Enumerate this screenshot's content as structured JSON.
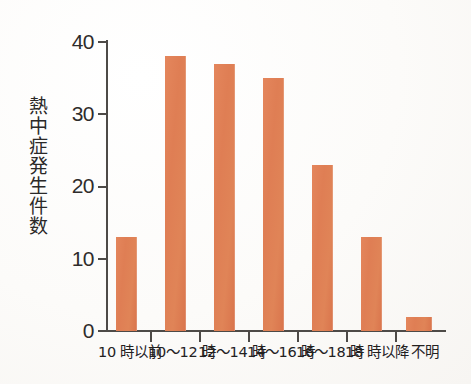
{
  "chart_data": {
    "type": "bar",
    "title": "",
    "subtitle": "",
    "xlabel": "",
    "ylabel": "熱中症発生件数",
    "categories": [
      "10 時以前",
      "10〜12 時",
      "12〜14 時",
      "14〜16 時",
      "16〜18 時",
      "18 時以降",
      "不明"
    ],
    "values": [
      13,
      38,
      37,
      35,
      23,
      13,
      2
    ],
    "ylim": [
      0,
      40
    ],
    "yticks": [
      0,
      10,
      20,
      30,
      40
    ],
    "ytick_labels": [
      "0",
      "10",
      "20",
      "30",
      "40"
    ],
    "grid": false,
    "legend": null,
    "bar_color": "#df7e54",
    "axis_color": "#4d4a47",
    "background_color": "#fdfdfc",
    "annotations": []
  }
}
